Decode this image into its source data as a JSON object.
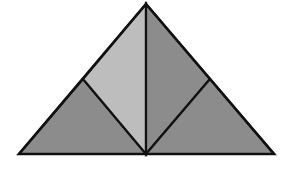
{
  "diagram": {
    "colors": {
      "background": "#ffffff",
      "light_fill": "#bdbdbd",
      "dark_fill": "#8c8c8c",
      "stroke": "#111111"
    },
    "points": {
      "apex": [
        146,
        4
      ],
      "base_left": [
        19,
        154
      ],
      "base_right": [
        274,
        154
      ],
      "base_mid": [
        146,
        154
      ],
      "left_mid": [
        83,
        79
      ],
      "right_mid": [
        210,
        79
      ]
    },
    "pieces": [
      {
        "name": "bottom-left-triangle",
        "fill": "dark_fill"
      },
      {
        "name": "upper-left-quadrilateral",
        "fill": "light_fill"
      },
      {
        "name": "upper-right-quadrilateral",
        "fill": "dark_fill"
      },
      {
        "name": "bottom-right-triangle",
        "fill": "dark_fill"
      }
    ]
  }
}
